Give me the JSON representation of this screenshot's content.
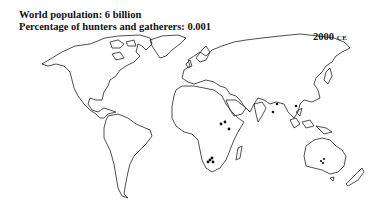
{
  "header": {
    "population_label": "World population: 6 billion",
    "hg_percentage_label": "Percentage of hunters and gatherers: 0.001"
  },
  "era": {
    "year": "2000",
    "suffix": "CE"
  },
  "map": {
    "description": "World outline map with scattered dots showing remaining hunter-gatherer populations",
    "dot_regions": [
      "East Africa",
      "Southern Africa (Kalahari)",
      "Central Australia",
      "South Asia",
      "Southeast Asia"
    ],
    "colors": {
      "outline": "#222222",
      "dots": "#111111",
      "background": "#ffffff"
    }
  }
}
